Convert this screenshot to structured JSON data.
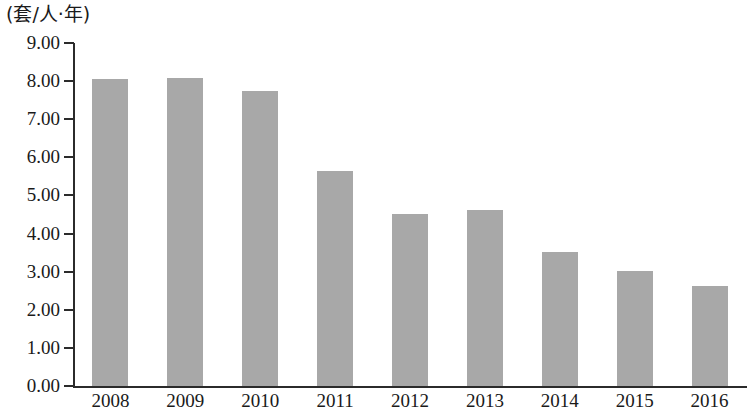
{
  "chart_data": {
    "type": "bar",
    "title": "",
    "subtitle": "",
    "xlabel": "",
    "ylabel": "(套/人·年)",
    "unit_label": "(套/人·年)",
    "categories": [
      "2008",
      "2009",
      "2010",
      "2011",
      "2012",
      "2013",
      "2014",
      "2015",
      "2016"
    ],
    "values": [
      8.05,
      8.07,
      7.75,
      5.65,
      4.51,
      4.62,
      3.52,
      3.03,
      2.63
    ],
    "series": [
      {
        "name": "",
        "values": [
          8.05,
          8.07,
          7.75,
          5.65,
          4.51,
          4.62,
          3.52,
          3.03,
          2.63
        ]
      }
    ],
    "ylim": [
      0,
      9
    ],
    "ytick_values": [
      0,
      1,
      2,
      3,
      4,
      5,
      6,
      7,
      8,
      9
    ],
    "ytick_labels": [
      "0.00",
      "1.00",
      "2.00",
      "3.00",
      "4.00",
      "5.00",
      "6.00",
      "7.00",
      "8.00",
      "9.00"
    ],
    "grid": false,
    "legend": null,
    "legend_position": "none",
    "bar_color": "#a8a8a8",
    "axis_color": "#2b2b2b",
    "background_color": "#ffffff"
  }
}
